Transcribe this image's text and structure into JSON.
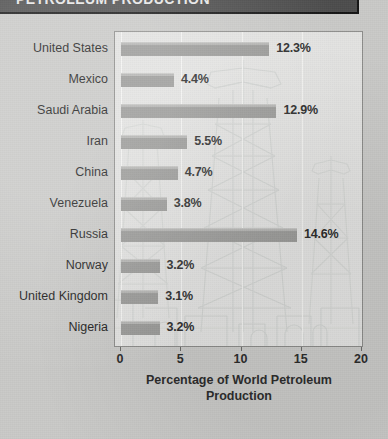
{
  "header": {
    "title": "PETROLEUM PRODUCTION"
  },
  "chart_data": {
    "type": "bar",
    "orientation": "horizontal",
    "title": "PETROLEUM PRODUCTION",
    "categories": [
      "United States",
      "Mexico",
      "Saudi Arabia",
      "Iran",
      "China",
      "Venezuela",
      "Russia",
      "Norway",
      "United Kingdom",
      "Nigeria"
    ],
    "values": [
      12.3,
      4.4,
      12.9,
      5.5,
      4.7,
      3.8,
      14.6,
      3.2,
      3.1,
      3.2
    ],
    "value_labels": [
      "12.3%",
      "4.4%",
      "12.9%",
      "5.5%",
      "4.7%",
      "3.8%",
      "14.6%",
      "3.2%",
      "3.1%",
      "3.2%"
    ],
    "xlabel": "Percentage of World Petroleum Production",
    "xlabel_line1": "Percentage of World Petroleum",
    "xlabel_line2": "Production",
    "ylabel": "",
    "xlim": [
      0,
      20
    ],
    "xticks": [
      0,
      5,
      10,
      15,
      20
    ],
    "xtick_labels": [
      "0",
      "5",
      "10",
      "15",
      "20"
    ],
    "grid": true,
    "legend": false,
    "units": "percent",
    "colors": {
      "bar": "#9a9a98",
      "bar_highlight": "#b4b4b2",
      "panel_background": "#e3e3e1",
      "page_background": "#c9c9c7",
      "title_band": "#4c4c4c",
      "text": "#2b2b2b",
      "gridline": "#f4f4f2"
    },
    "background_art": "oil-derrick-watermark"
  }
}
